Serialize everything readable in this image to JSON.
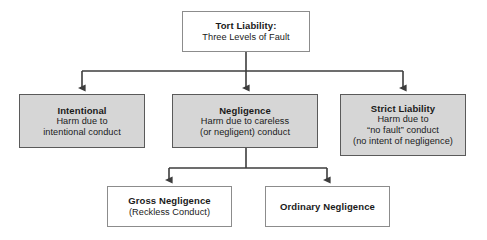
{
  "diagram": {
    "type": "hierarchical-flowchart",
    "title_node": {
      "id": "tort-liability",
      "title": "Tort Liability:",
      "lines": [
        "Three Levels of Fault"
      ],
      "style": "white",
      "x": 182,
      "y": 11,
      "w": 128,
      "h": 41
    },
    "levels": [
      {
        "id": "intentional",
        "title": "Intentional",
        "lines": [
          "Harm due to",
          "intentional conduct"
        ],
        "style": "gray",
        "x": 19,
        "y": 94,
        "w": 126,
        "h": 54
      },
      {
        "id": "negligence",
        "title": "Negligence",
        "lines": [
          "Harm due to careless",
          "(or negligent) conduct"
        ],
        "style": "gray",
        "x": 172,
        "y": 94,
        "w": 146,
        "h": 54
      },
      {
        "id": "strict-liability",
        "title": "Strict Liability",
        "lines": [
          "Harm due to",
          "“no fault” conduct",
          "(no intent of negligence)"
        ],
        "style": "gray",
        "x": 340,
        "y": 94,
        "w": 126,
        "h": 62
      }
    ],
    "sublevels": [
      {
        "id": "gross-negligence",
        "title": "Gross Negligence",
        "lines": [
          "(Reckless Conduct)"
        ],
        "style": "white",
        "x": 107,
        "y": 186,
        "w": 125,
        "h": 41
      },
      {
        "id": "ordinary-negligence",
        "title": "Ordinary Negligence",
        "lines": [],
        "style": "white",
        "x": 265,
        "y": 186,
        "w": 125,
        "h": 41
      }
    ],
    "connectors": {
      "line_color": "#3d3d3d",
      "top_bus_y": 71,
      "top_bus_x1": 82,
      "top_bus_x2": 403,
      "lower_bus_y": 168,
      "lower_bus_x1": 169,
      "lower_bus_x2": 327
    },
    "colors": {
      "background": "#ffffff",
      "gray_fill": "#d6d6d6",
      "gray_border": "#5a5a5a",
      "white_fill": "#ffffff",
      "white_border": "#8c8c8c",
      "text": "#1a1a1a",
      "connector": "#3d3d3d"
    }
  }
}
